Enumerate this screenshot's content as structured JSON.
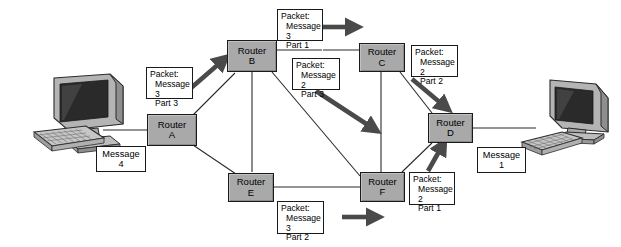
{
  "diagram": {
    "colors": {
      "router_fill": "#a9a9a9",
      "router_border": "#1a1a1a",
      "label_fill": "#ffffff",
      "arrow_fill": "#4a4a4a",
      "wire": "#2b2b2b",
      "background": "#ffffff"
    }
  },
  "routers": [
    {
      "id": "a",
      "line1": "Router",
      "line2": "A"
    },
    {
      "id": "b",
      "line1": "Router",
      "line2": "B"
    },
    {
      "id": "c",
      "line1": "Router",
      "line2": "C"
    },
    {
      "id": "d",
      "line1": "Router",
      "line2": "D"
    },
    {
      "id": "e",
      "line1": "Router",
      "line2": "E"
    },
    {
      "id": "f",
      "line1": "Router",
      "line2": "F"
    }
  ],
  "messages": [
    {
      "id": "msg4",
      "line1": "Message",
      "line2": "4"
    },
    {
      "id": "msg1",
      "line1": "Message",
      "line2": "1"
    }
  ],
  "packets": [
    {
      "id": "m3p3",
      "head": "Packet:",
      "message": "Message 3",
      "part": "Part 3"
    },
    {
      "id": "m3p1",
      "head": "Packet:",
      "message": "Message 3",
      "part": "Part 1"
    },
    {
      "id": "m2p3",
      "head": "Packet:",
      "message": "Message 2",
      "part": "Part 3"
    },
    {
      "id": "m2p2",
      "head": "Packet:",
      "message": "Message 2",
      "part": "Part 2"
    },
    {
      "id": "m2p1",
      "head": "Packet:",
      "message": "Message 2",
      "part": "Part 1"
    },
    {
      "id": "m3p2",
      "head": "Packet:",
      "message": "Message 3",
      "part": "Part 2"
    }
  ],
  "computers": [
    {
      "id": "left",
      "name": "sender-workstation"
    },
    {
      "id": "right",
      "name": "receiver-workstation"
    }
  ]
}
